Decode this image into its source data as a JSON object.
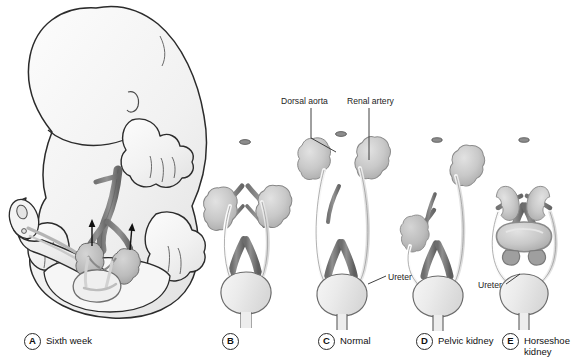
{
  "figure": {
    "background_color": "#ffffff",
    "palette": {
      "outline": "#2b2b2b",
      "thin_outline": "#555555",
      "aorta": "#7c7c7c",
      "aorta_dark": "#5e5e5e",
      "aorta_light": "#9a9a9a",
      "kidney": "#c6c6c6",
      "kidney_shadow": "#a9a9a9",
      "kidney_light": "#dcdcdc",
      "bladder": "#ececec",
      "ureter": "#f2f2f2",
      "embryo_body": "#f3f3f3",
      "embryo_shadow": "#e2e2e2",
      "cord": "#ededed",
      "arrow": "#111111",
      "leader": "#2b2b2b"
    }
  },
  "annotations": [
    {
      "id": "dorsal-aorta",
      "label": "Dorsal aorta",
      "x": 281,
      "y": 96
    },
    {
      "id": "renal-artery",
      "label": "Renal artery",
      "x": 347,
      "y": 96
    },
    {
      "id": "ureter-c",
      "label": "Ureter",
      "x": 388,
      "y": 272
    },
    {
      "id": "ureter-e",
      "label": "Ureter",
      "x": 478,
      "y": 280
    }
  ],
  "panels": [
    {
      "letter": "A",
      "label": "Sixth week",
      "x": 24,
      "y": 333
    },
    {
      "letter": "B",
      "label": "",
      "x": 222,
      "y": 333
    },
    {
      "letter": "C",
      "label": "Normal",
      "x": 318,
      "y": 333
    },
    {
      "letter": "D",
      "label": "Pelvic kidney",
      "x": 416,
      "y": 333
    },
    {
      "letter": "E",
      "label": "Horseshoe\nkidney",
      "x": 502,
      "y": 333
    }
  ]
}
